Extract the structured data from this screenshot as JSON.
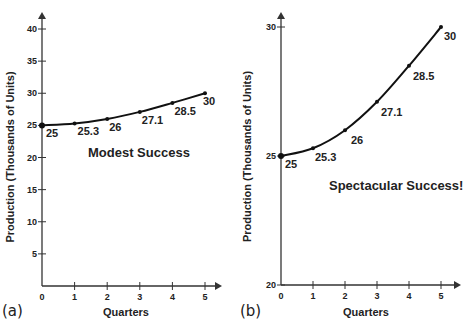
{
  "chart_data": [
    {
      "type": "line",
      "panel": "(a)",
      "title": "",
      "annotation": "Modest Success",
      "xlabel": "Quarters",
      "ylabel": "Production (Thousands of Units)",
      "x": [
        0,
        1,
        2,
        3,
        4,
        5
      ],
      "values": [
        25,
        25.3,
        26,
        27.1,
        28.5,
        30
      ],
      "data_labels": [
        "25",
        "25.3",
        "26",
        "27.1",
        "28.5",
        "30"
      ],
      "xticks": [
        "0",
        "1",
        "2",
        "3",
        "4",
        "5"
      ],
      "yticks": [
        "5",
        "10",
        "15",
        "20",
        "25",
        "30",
        "35",
        "40"
      ],
      "xlim": [
        0,
        5
      ],
      "ylim": [
        0,
        40
      ],
      "grid": false
    },
    {
      "type": "line",
      "panel": "(b)",
      "title": "",
      "annotation": "Spectacular Success!",
      "xlabel": "Quarters",
      "ylabel": "Production (Thousands of Units)",
      "x": [
        0,
        1,
        2,
        3,
        4,
        5
      ],
      "values": [
        25,
        25.3,
        26,
        27.1,
        28.5,
        30
      ],
      "data_labels": [
        "25",
        "25.3",
        "26",
        "27.1",
        "28.5",
        "30"
      ],
      "xticks": [
        "0",
        "1",
        "2",
        "3",
        "4",
        "5"
      ],
      "yticks": [
        "20",
        "25",
        "30"
      ],
      "xlim": [
        0,
        5
      ],
      "ylim": [
        20,
        30
      ],
      "grid": false
    }
  ],
  "colors": {
    "line": "#111111",
    "axis": "#333333",
    "text": "#222222"
  }
}
